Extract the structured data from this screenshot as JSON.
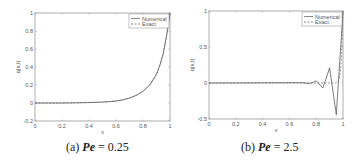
{
  "chart_data": [
    {
      "type": "line",
      "panel_label": "(a)",
      "caption_prefix": "(a)",
      "caption_var": "Pe",
      "caption_value": "= 0.25",
      "xlabel": "x",
      "ylabel": "q(x,t)",
      "xlim": [
        0,
        1
      ],
      "ylim": [
        -0.2,
        1
      ],
      "xticks": [
        "0",
        "0.2",
        "0.4",
        "0.6",
        "0.8",
        "1"
      ],
      "yticks": [
        "-0.2",
        "0",
        "0.2",
        "0.4",
        "0.6",
        "0.8",
        "1"
      ],
      "legend": [
        "Numerical",
        "Exact"
      ],
      "legend_position": "upper right",
      "series": [
        {
          "name": "Numerical",
          "style": "solid",
          "x": [
            0,
            0.1,
            0.2,
            0.3,
            0.4,
            0.5,
            0.6,
            0.65,
            0.7,
            0.75,
            0.8,
            0.85,
            0.9,
            0.925,
            0.95,
            0.975,
            1.0
          ],
          "y": [
            0,
            0,
            0,
            0.002,
            0.005,
            0.01,
            0.022,
            0.035,
            0.055,
            0.085,
            0.13,
            0.2,
            0.32,
            0.42,
            0.55,
            0.75,
            1.0
          ]
        },
        {
          "name": "Exact",
          "style": "dashed",
          "x": [
            0,
            0.1,
            0.2,
            0.3,
            0.4,
            0.5,
            0.6,
            0.65,
            0.7,
            0.75,
            0.8,
            0.85,
            0.9,
            0.925,
            0.95,
            0.975,
            1.0
          ],
          "y": [
            0,
            0,
            0,
            0.002,
            0.005,
            0.01,
            0.022,
            0.035,
            0.055,
            0.085,
            0.13,
            0.2,
            0.32,
            0.42,
            0.55,
            0.75,
            1.0
          ]
        }
      ]
    },
    {
      "type": "line",
      "panel_label": "(b)",
      "caption_prefix": "(b)",
      "caption_var": "Pe",
      "caption_value": "= 2.5",
      "xlabel": "x",
      "ylabel": "q(x,t)",
      "xlim": [
        0,
        1
      ],
      "ylim": [
        -0.5,
        1
      ],
      "xticks": [
        "0",
        "0.2",
        "0.4",
        "0.6",
        "0.8",
        "1"
      ],
      "yticks": [
        "-0.5",
        "0",
        "0.5",
        "1"
      ],
      "legend": [
        "Numerical",
        "Exact"
      ],
      "legend_position": "upper right",
      "series": [
        {
          "name": "Numerical",
          "style": "solid",
          "x": [
            0,
            0.7,
            0.75,
            0.8,
            0.85,
            0.9,
            0.95,
            1.0
          ],
          "y": [
            0,
            0.005,
            -0.01,
            0.03,
            -0.07,
            0.21,
            -0.44,
            1.0
          ]
        },
        {
          "name": "Exact",
          "style": "dashed",
          "x": [
            0,
            0.9,
            0.95,
            0.97,
            0.98,
            0.99,
            1.0
          ],
          "y": [
            0,
            0,
            0.0,
            0.05,
            0.15,
            0.4,
            1.0
          ]
        }
      ]
    }
  ]
}
